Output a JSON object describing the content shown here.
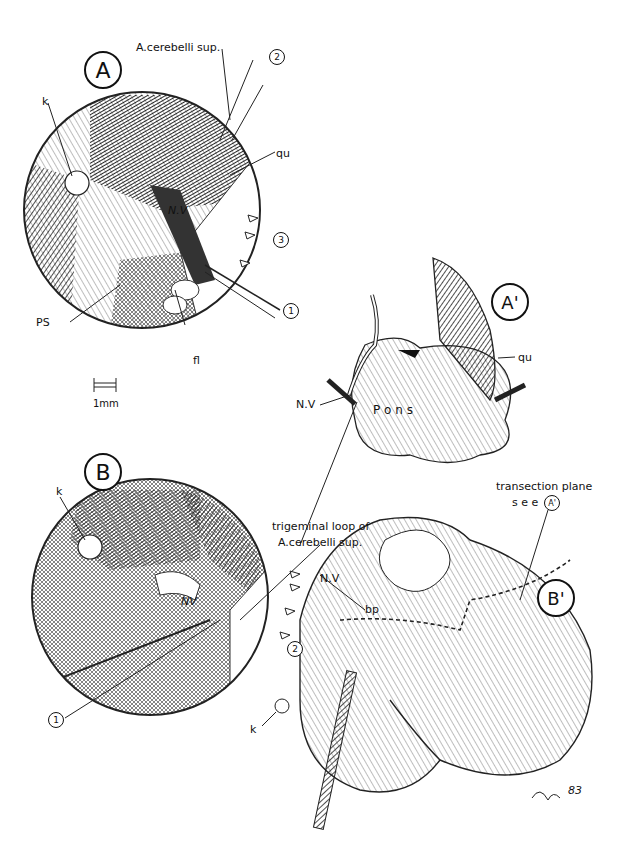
{
  "figure": {
    "panels": [
      {
        "id": "A",
        "label": "A"
      },
      {
        "id": "A_prime",
        "label": "A'"
      },
      {
        "id": "B",
        "label": "B"
      },
      {
        "id": "B_prime",
        "label": "B'"
      }
    ],
    "panel_A": {
      "artery_label": "A.cerebelli sup.",
      "k": "k",
      "qu": "qu",
      "nerve": "N.V",
      "ps": "PS",
      "fl": "fl",
      "markers": [
        "1",
        "2",
        "3"
      ]
    },
    "scale_bar": {
      "label": "1mm"
    },
    "panel_A_prime": {
      "nerve": "N.V",
      "pons": "P o n s",
      "qu": "qu"
    },
    "panel_B": {
      "k": "k",
      "nerve": "NV",
      "markers": [
        "1",
        "2"
      ]
    },
    "panel_B_prime": {
      "loop_label_line1": "trigeminal loop of",
      "loop_label_line2": "A.cerebelli sup.",
      "plane_label_line1": "transection plane",
      "plane_label_line2": "s e e",
      "plane_ref": "A'",
      "nerve": "N.V",
      "bp": "bp",
      "k": "k",
      "signature": "83"
    }
  }
}
